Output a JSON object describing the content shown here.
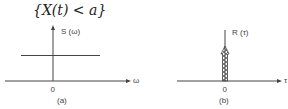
{
  "title": "{X(t) < a}",
  "colors": {
    "ink": "#444444",
    "background": "#ffffff"
  },
  "panel_a": {
    "ylabel": "S (ω)",
    "xlabel": "ω",
    "origin": "0",
    "caption": "(a)"
  },
  "panel_b": {
    "ylabel": "R (τ)",
    "xlabel": "τ",
    "origin": "0",
    "caption": "(b)"
  }
}
